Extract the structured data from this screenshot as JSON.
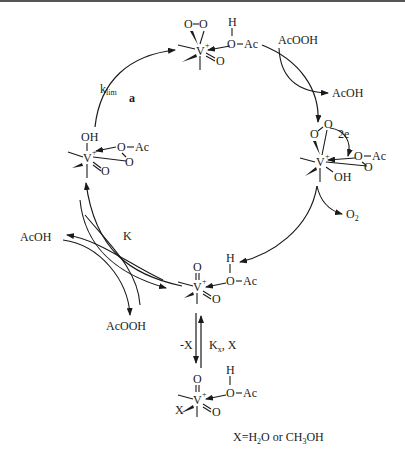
{
  "figure": {
    "panel_label": "a",
    "rate_constants": {
      "klim": "k",
      "klim_sub": "lim",
      "K": "K",
      "Kx": "K",
      "Kx_sub": "x",
      "Kx_suffix": ", X",
      "minus_x": "-X"
    },
    "species": {
      "reagent_top": "AcOOH",
      "product_top": "AcOH",
      "product_o2": "O",
      "product_o2_sub": "2",
      "left_out": "AcOH",
      "left_in": "AcOOH"
    },
    "atoms": {
      "V": "V",
      "charge": "+",
      "O": "O",
      "OH": "OH",
      "H": "H",
      "Ac": "Ac",
      "X": "X",
      "electrons": "2e"
    },
    "legend": {
      "x_def_1": "X=H",
      "x_def_sub1": "2",
      "x_def_2": "O or CH",
      "x_def_sub2": "3",
      "x_def_3": "OH"
    }
  }
}
